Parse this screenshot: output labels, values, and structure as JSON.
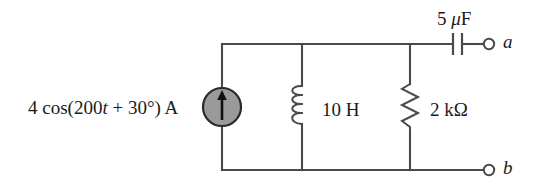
{
  "figure": {
    "kind": "circuit-schematic",
    "width": 550,
    "height": 196,
    "background_color": "#ffffff",
    "wire_color": "#4a4a4a",
    "text_color": "#1b1b1b",
    "source_fill_color": "#9a9a9a",
    "source_stroke_color": "#2a2a2a"
  },
  "components": {
    "current_source": {
      "symbol": "current-source-circle-arrow",
      "label_prefix": "4 cos(200",
      "label_italic": "t",
      "label_suffix": " + 30°) A",
      "label_full": "4 cos(200t + 30°) A",
      "arrow_direction": "up"
    },
    "inductor": {
      "symbol": "inductor-coil",
      "label": "10 H",
      "value": "10",
      "unit": "H",
      "coil_loops": 4
    },
    "resistor": {
      "symbol": "resistor-zigzag",
      "label": "2 kΩ",
      "value": "2",
      "unit": "kΩ",
      "zigzag_segments": 6
    },
    "capacitor": {
      "symbol": "capacitor-parallel-plates",
      "label_value": "5 ",
      "label_mu": "μ",
      "label_unit": "F",
      "label_full": "5 μF",
      "value": "5",
      "unit": "μF"
    }
  },
  "terminals": {
    "a": {
      "label": "a",
      "symbol": "open-terminal-circle"
    },
    "b": {
      "label": "b",
      "symbol": "open-terminal-circle"
    }
  }
}
